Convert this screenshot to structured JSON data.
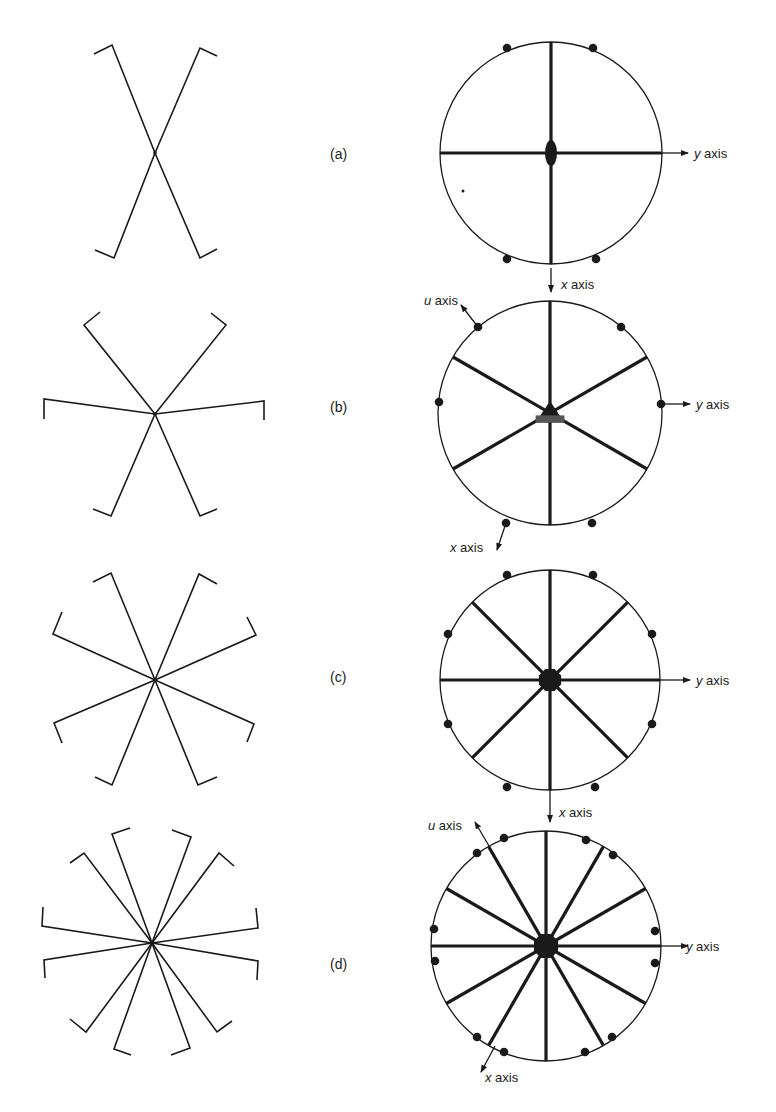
{
  "figure": {
    "stroke_color": "#1a1a1a",
    "panels": [
      {
        "id": "a",
        "label": "(a)",
        "label_pos": [
          330,
          159
        ],
        "wires": {
          "center": [
            155,
            153
          ],
          "ends": [
            [
              112,
              45
            ],
            [
              200,
              48
            ],
            [
              114,
              258
            ],
            [
              200,
              258
            ]
          ],
          "hooks": [
            [
              94,
              54
            ],
            [
              217,
              56
            ],
            [
              95,
              250
            ],
            [
              217,
              249
            ]
          ]
        },
        "circle": {
          "center": [
            551,
            153
          ],
          "r": 111,
          "spoke_angles": [
            0,
            90
          ],
          "hub": {
            "shape": "ellipse",
            "rx": 6,
            "ry": 13
          },
          "dots": [
            [
              507,
              48
            ],
            [
              593,
              48
            ],
            [
              507,
              259
            ],
            [
              596,
              259
            ]
          ],
          "stray_dot": [
            463,
            191
          ]
        },
        "axes": [
          {
            "name": "y",
            "text_var": "y",
            "text_rest": " axis",
            "from": [
              662,
              153
            ],
            "to": [
              688,
              153
            ],
            "label_at": [
              694,
              158
            ]
          },
          {
            "name": "x",
            "text_var": "x",
            "text_rest": " axis",
            "from": [
              551,
              268
            ],
            "to": [
              551,
              292
            ],
            "label_at": [
              561,
              289
            ]
          }
        ]
      },
      {
        "id": "b",
        "label": "(b)",
        "label_pos": [
          330,
          412
        ],
        "wires": {
          "center": [
            155,
            414
          ],
          "ends": [
            [
              84,
              325
            ],
            [
              226,
              325
            ],
            [
              44,
              399
            ],
            [
              264,
              401
            ],
            [
              111,
              516
            ],
            [
              200,
              516
            ]
          ],
          "hooks": [
            [
              100,
              312
            ],
            [
              211,
              313
            ],
            [
              44,
              419
            ],
            [
              264,
              420
            ],
            [
              93,
              509
            ],
            [
              217,
              509
            ]
          ]
        },
        "circle": {
          "center": [
            550,
            413
          ],
          "r": 112,
          "spoke_angles": [
            90,
            30,
            150
          ],
          "hub": {
            "shape": "triangle",
            "size": 12
          },
          "dots": [
            [
              478,
              327
            ],
            [
              621,
              327
            ],
            [
              439,
              402
            ],
            [
              661,
              404
            ],
            [
              506,
              523
            ],
            [
              592,
              523
            ]
          ]
        },
        "axes": [
          {
            "name": "u",
            "text_var": "u",
            "text_rest": " axis",
            "from": [
              478,
              327
            ],
            "to": [
              461,
              305
            ],
            "label_at": [
              424,
              305
            ]
          },
          {
            "name": "y",
            "text_var": "y",
            "text_rest": " axis",
            "from": [
              661,
              404
            ],
            "to": [
              690,
              404
            ],
            "label_at": [
              696,
              409
            ]
          },
          {
            "name": "x",
            "text_var": "x",
            "text_rest": " axis",
            "from": [
              506,
              523
            ],
            "to": [
              497,
              550
            ],
            "label_at": [
              450,
              552
            ]
          }
        ]
      },
      {
        "id": "c",
        "label": "(c)",
        "label_pos": [
          330,
          682
        ],
        "wires": {
          "center": [
            155,
            680
          ],
          "ends": [
            [
              111,
              573
            ],
            [
              199,
              574
            ],
            [
              53,
              634
            ],
            [
              256,
              635
            ],
            [
              54,
              723
            ],
            [
              254,
              724
            ],
            [
              112,
              785
            ],
            [
              198,
              785
            ]
          ],
          "hooks": [
            [
              93,
              582
            ],
            [
              217,
              584
            ],
            [
              62,
              612
            ],
            [
              247,
              617
            ],
            [
              62,
              743
            ],
            [
              247,
              742
            ],
            [
              95,
              777
            ],
            [
              217,
              777
            ]
          ]
        },
        "circle": {
          "center": [
            550,
            680
          ],
          "r": 110,
          "spoke_angles": [
            0,
            45,
            90,
            135
          ],
          "hub": {
            "shape": "octagon",
            "size": 12
          },
          "dots": [
            [
              507,
              575
            ],
            [
              593,
              575
            ],
            [
              448,
              634
            ],
            [
              652,
              634
            ],
            [
              448,
              724
            ],
            [
              652,
              724
            ],
            [
              507,
              787
            ],
            [
              595,
              787
            ]
          ]
        },
        "axes": [
          {
            "name": "y",
            "text_var": "y",
            "text_rest": " axis",
            "from": [
              660,
              680
            ],
            "to": [
              690,
              680
            ],
            "label_at": [
              696,
              685
            ]
          },
          {
            "name": "x",
            "text_var": "x",
            "text_rest": " axis",
            "from": [
              550,
              790
            ],
            "to": [
              550,
              822
            ],
            "label_at": [
              559,
              817
            ]
          }
        ]
      },
      {
        "id": "d",
        "label": "(d)",
        "label_pos": [
          330,
          969
        ],
        "wires": {
          "center": [
            152,
            943
          ],
          "ends": [
            [
              112,
              834
            ],
            [
              191,
              837
            ],
            [
              84,
              853
            ],
            [
              219,
              853
            ],
            [
              42,
              926
            ],
            [
              258,
              928
            ],
            [
              44,
              960
            ],
            [
              258,
              961
            ],
            [
              86,
              1032
            ],
            [
              217,
              1032
            ],
            [
              114,
              1049
            ],
            [
              190,
              1048
            ]
          ],
          "hooks": [
            [
              130,
              828
            ],
            [
              172,
              830
            ],
            [
              70,
              863
            ],
            [
              234,
              866
            ],
            [
              43,
              907
            ],
            [
              256,
              908
            ],
            [
              45,
              978
            ],
            [
              257,
              980
            ],
            [
              70,
              1019
            ],
            [
              232,
              1021
            ],
            [
              131,
              1055
            ],
            [
              171,
              1055
            ]
          ]
        },
        "circle": {
          "center": [
            546,
            946
          ],
          "r": 115,
          "spoke_angles": [
            0,
            30,
            60,
            90,
            120,
            150
          ],
          "hub": {
            "shape": "octagon",
            "size": 13
          },
          "dots": [
            [
              504,
              838
            ],
            [
              586,
              840
            ],
            [
              477,
              853
            ],
            [
              613,
              855
            ],
            [
              434,
              929
            ],
            [
              655,
              931
            ],
            [
              435,
              961
            ],
            [
              655,
              963
            ],
            [
              477,
              1037
            ],
            [
              612,
              1037
            ],
            [
              504,
              1052
            ],
            [
              585,
              1052
            ]
          ]
        },
        "axes": [
          {
            "name": "u",
            "text_var": "u",
            "text_rest": " axis",
            "from": [
              489,
              846
            ],
            "to": [
              475,
              822
            ],
            "label_at": [
              428,
              830
            ]
          },
          {
            "name": "y",
            "text_var": "y",
            "text_rest": " axis",
            "from": [
              661,
              946
            ],
            "to": [
              688,
              946
            ],
            "label_at": [
              686,
              951
            ]
          },
          {
            "name": "x",
            "text_var": "x",
            "text_rest": " axis",
            "from": [
              495,
              1046
            ],
            "to": [
              481,
              1072
            ],
            "label_at": [
              485,
              1082
            ]
          }
        ]
      }
    ]
  }
}
